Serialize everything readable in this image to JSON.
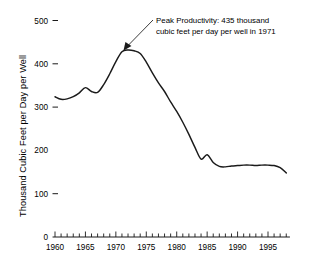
{
  "chart_data": {
    "type": "line",
    "title": "",
    "subtitle": "",
    "xlabel": "",
    "ylabel": "Thousand Cubic Feet per Day per Well",
    "xlim": [
      1959.5,
      1998.5
    ],
    "ylim": [
      0,
      500
    ],
    "grid": false,
    "legend": "none",
    "y_ticks": [
      0,
      100,
      200,
      300,
      400,
      500
    ],
    "y_tick_labels": [
      "0",
      "100",
      "200",
      "300",
      "400",
      "500"
    ],
    "x_tick_labels": [
      "1960",
      "1965",
      "1970",
      "1975",
      "1980",
      "1985",
      "1990",
      "1995"
    ],
    "x_tick_values": [
      1960,
      1965,
      1970,
      1975,
      1980,
      1985,
      1990,
      1995
    ],
    "x_minor_tick_interval": 1,
    "line_color": "#1a1a1a",
    "series": [
      {
        "name": "Natural gas productivity per well",
        "x": [
          1960,
          1961,
          1962,
          1963,
          1964,
          1965,
          1966,
          1967,
          1968,
          1969,
          1970,
          1971,
          1972,
          1973,
          1974,
          1975,
          1976,
          1977,
          1978,
          1979,
          1980,
          1981,
          1982,
          1983,
          1984,
          1985,
          1986,
          1987,
          1988,
          1989,
          1990,
          1991,
          1992,
          1993,
          1994,
          1995,
          1996,
          1997,
          1998
        ],
        "values": [
          324,
          318,
          319,
          324,
          333,
          345,
          336,
          334,
          352,
          377,
          405,
          428,
          432,
          430,
          424,
          404,
          379,
          356,
          336,
          312,
          290,
          265,
          237,
          207,
          180,
          190,
          172,
          163,
          162,
          164,
          165,
          166,
          166,
          165,
          166,
          166,
          165,
          160,
          148
        ]
      }
    ],
    "annotations": [
      {
        "id": "peak-callout",
        "line1": "Peak Productivity:  435 thousand",
        "line2": "cubic feet per day per well in 1971",
        "points_to_x": 1971,
        "points_to_y": 435,
        "peak_value": 435,
        "peak_year": 1971
      }
    ]
  },
  "axis": {
    "y_title": "Thousand Cubic Feet per Day per Well"
  }
}
